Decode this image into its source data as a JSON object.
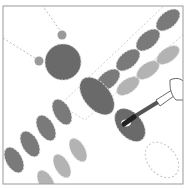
{
  "illustration": {
    "subject": "dragonfly painting step",
    "colors": {
      "background": "#ffffff",
      "frame": "#9a9a9a",
      "body_dark": "#6a6a6a",
      "wing_dark": "#7a7a7a",
      "wing_light": "#b0b0b0",
      "stitch": "#d0d0d0",
      "brush_tip": "#222222"
    }
  }
}
